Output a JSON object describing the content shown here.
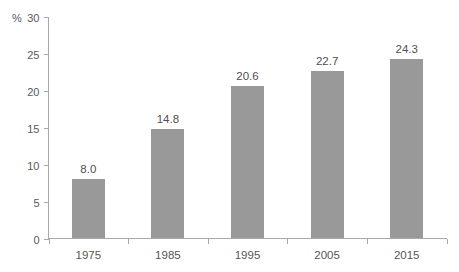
{
  "chart_data": {
    "type": "bar",
    "title": "",
    "subtitle": "",
    "xlabel": "",
    "ylabel": "%",
    "categories": [
      "1975",
      "1985",
      "1995",
      "2005",
      "2015"
    ],
    "values": [
      8.0,
      14.8,
      20.6,
      22.7,
      24.3
    ],
    "value_labels": [
      "8.0",
      "14.8",
      "20.6",
      "22.7",
      "24.3"
    ],
    "ylim": [
      0,
      30
    ],
    "ytick_step": 5,
    "ytick_labels": [
      "0",
      "5",
      "10",
      "15",
      "20",
      "25",
      "30"
    ],
    "ytick_values": [
      0,
      5,
      10,
      15,
      20,
      25,
      30
    ],
    "unit_prefix": "%",
    "grid": false,
    "legend": false,
    "legend_position": "none",
    "series": [
      {
        "name": "",
        "values": [
          8.0,
          14.8,
          20.6,
          22.7,
          24.3
        ]
      }
    ],
    "colors": {
      "bar_fill": "#999999",
      "axis": "#a9a9a9",
      "tick_text": "#595959",
      "value_text": "#4f4f4f",
      "category_text": "#555555",
      "background": "#ffffff"
    }
  }
}
